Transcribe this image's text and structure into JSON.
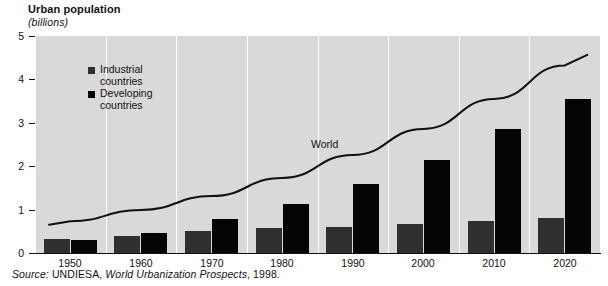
{
  "header": {
    "title": "Urban population",
    "subtitle": "(billions)"
  },
  "legend": {
    "position": "inside-top-left",
    "items": [
      {
        "label_line1": "Industrial",
        "label_line2": "countries",
        "color": "#2f2f2f",
        "name": "industrial-countries"
      },
      {
        "label_line1": "Developing",
        "label_line2": "countries",
        "color": "#050505",
        "name": "developing-countries"
      }
    ]
  },
  "annotations": [
    {
      "text": "World",
      "name": "world-line-label"
    }
  ],
  "source": {
    "prefix": "Source:",
    "publisher": "UNDIESA,",
    "work": "World Urbanization Prospects",
    "year": ", 1998."
  },
  "chart_data": {
    "type": "bar",
    "title": "Urban population",
    "subtitle": "(billions)",
    "xlabel": "",
    "ylabel": "billions",
    "ylim": [
      0,
      5
    ],
    "yticks": [
      0,
      1,
      2,
      3,
      4,
      5
    ],
    "ytick_labels": [
      "0",
      "1",
      "2",
      "3",
      "4",
      "5"
    ],
    "grid": "vertical-white-separators",
    "categories": [
      "1950",
      "1960",
      "1970",
      "1980",
      "1990",
      "2000",
      "2010",
      "2020"
    ],
    "series": [
      {
        "name": "Industrial countries",
        "color": "#2f2f2f",
        "values": [
          0.32,
          0.4,
          0.5,
          0.58,
          0.61,
          0.66,
          0.73,
          0.8
        ]
      },
      {
        "name": "Developing countries",
        "color": "#050505",
        "values": [
          0.31,
          0.47,
          0.78,
          1.13,
          1.6,
          2.15,
          2.85,
          3.55
        ]
      }
    ],
    "overlay": {
      "type": "line",
      "name": "World",
      "color": "#111111",
      "x": [
        "1950",
        "1960",
        "1970",
        "1980",
        "1990",
        "2000",
        "2010",
        "2020"
      ],
      "values": [
        0.73,
        0.99,
        1.31,
        1.73,
        2.26,
        2.86,
        3.55,
        4.32
      ]
    }
  }
}
